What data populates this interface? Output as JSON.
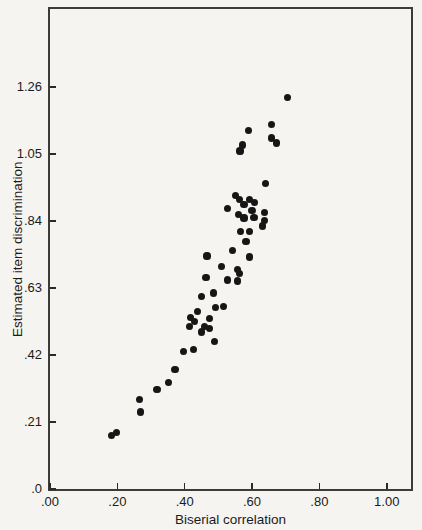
{
  "figure": {
    "background": "#f5f4f0",
    "ink": "#1b1b1b",
    "dot_color": "#161616",
    "border_color": "#3b3b3b"
  },
  "chart_data": {
    "type": "scatter",
    "title": "",
    "xlabel": "Biserial correlation",
    "ylabel": "Estimated item discrimination",
    "xlim": [
      0,
      1.072
    ],
    "ylim": [
      0,
      1.504
    ],
    "grid": false,
    "legend": false,
    "marker": "filled-circle",
    "x_ticks": [
      {
        "value": 0.0,
        "label": ".00"
      },
      {
        "value": 0.2,
        "label": ".20"
      },
      {
        "value": 0.4,
        "label": ".40"
      },
      {
        "value": 0.6,
        "label": ".60"
      },
      {
        "value": 0.8,
        "label": ".80"
      },
      {
        "value": 1.0,
        "label": "1.00"
      }
    ],
    "y_ticks": [
      {
        "value": 0.0,
        "label": ".0"
      },
      {
        "value": 0.21,
        "label": ".21"
      },
      {
        "value": 0.42,
        "label": ".42"
      },
      {
        "value": 0.63,
        "label": ".63"
      },
      {
        "value": 0.84,
        "label": ".84"
      },
      {
        "value": 1.05,
        "label": "1.05"
      },
      {
        "value": 1.26,
        "label": "1.26"
      }
    ],
    "points": [
      [
        0.705,
        1.227
      ],
      [
        0.657,
        1.143
      ],
      [
        0.59,
        1.123
      ],
      [
        0.657,
        1.1
      ],
      [
        0.672,
        1.084
      ],
      [
        0.572,
        1.078
      ],
      [
        0.564,
        1.059
      ],
      [
        0.64,
        0.957
      ],
      [
        0.551,
        0.919
      ],
      [
        0.562,
        0.908
      ],
      [
        0.593,
        0.907
      ],
      [
        0.607,
        0.898
      ],
      [
        0.576,
        0.891
      ],
      [
        0.528,
        0.879
      ],
      [
        0.6,
        0.873
      ],
      [
        0.637,
        0.866
      ],
      [
        0.56,
        0.859
      ],
      [
        0.576,
        0.849
      ],
      [
        0.606,
        0.851
      ],
      [
        0.637,
        0.842
      ],
      [
        0.631,
        0.824
      ],
      [
        0.566,
        0.807
      ],
      [
        0.593,
        0.807
      ],
      [
        0.582,
        0.776
      ],
      [
        0.542,
        0.748
      ],
      [
        0.466,
        0.73
      ],
      [
        0.593,
        0.727
      ],
      [
        0.51,
        0.698
      ],
      [
        0.557,
        0.689
      ],
      [
        0.563,
        0.674
      ],
      [
        0.463,
        0.663
      ],
      [
        0.528,
        0.655
      ],
      [
        0.557,
        0.652
      ],
      [
        0.486,
        0.614
      ],
      [
        0.449,
        0.602
      ],
      [
        0.492,
        0.568
      ],
      [
        0.516,
        0.572
      ],
      [
        0.438,
        0.557
      ],
      [
        0.418,
        0.537
      ],
      [
        0.473,
        0.535
      ],
      [
        0.43,
        0.524
      ],
      [
        0.415,
        0.509
      ],
      [
        0.458,
        0.51
      ],
      [
        0.474,
        0.502
      ],
      [
        0.451,
        0.492
      ],
      [
        0.489,
        0.462
      ],
      [
        0.396,
        0.432
      ],
      [
        0.426,
        0.436
      ],
      [
        0.371,
        0.375
      ],
      [
        0.352,
        0.334
      ],
      [
        0.318,
        0.311
      ],
      [
        0.266,
        0.28
      ],
      [
        0.268,
        0.241
      ],
      [
        0.182,
        0.168
      ],
      [
        0.198,
        0.176
      ]
    ]
  }
}
